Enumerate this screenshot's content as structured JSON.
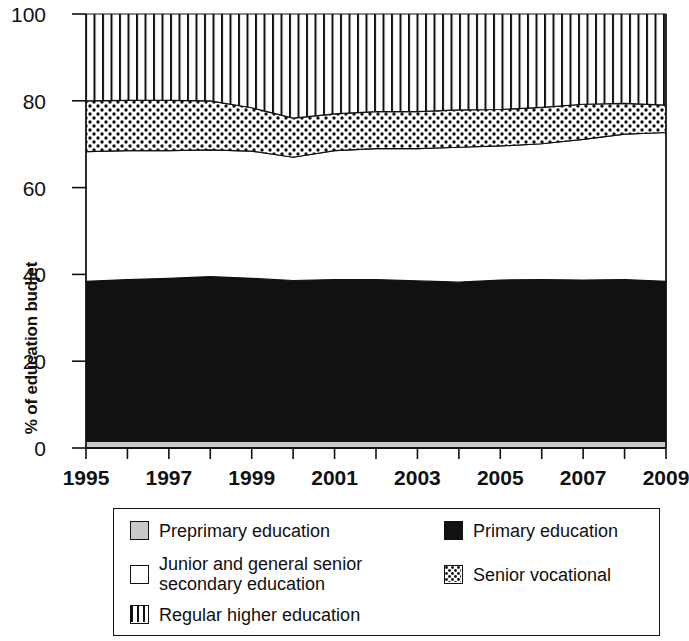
{
  "chart_data": {
    "type": "area",
    "title": "",
    "subtitle": "",
    "xlabel": "",
    "ylabel": "% of education budjet",
    "stacked": true,
    "grid": false,
    "legend_position": "bottom",
    "xlim": [
      1995,
      2009
    ],
    "ylim": [
      0,
      100
    ],
    "ytick_values": [
      0,
      20,
      40,
      60,
      80,
      100
    ],
    "ytick_labels": [
      "0",
      "20",
      "40",
      "60",
      "80",
      "100"
    ],
    "x": [
      1995,
      1996,
      1997,
      1998,
      1999,
      2000,
      2001,
      2002,
      2003,
      2004,
      2005,
      2006,
      2007,
      2008,
      2009
    ],
    "xtick_values": [
      1995,
      1996,
      1997,
      1998,
      1999,
      2000,
      2001,
      2002,
      2003,
      2004,
      2005,
      2006,
      2007,
      2008,
      2009
    ],
    "xtick_labels": [
      "1995",
      "",
      "1997",
      "",
      "1999",
      "",
      "2001",
      "",
      "2003",
      "",
      "2005",
      "",
      "2007",
      "",
      "2009"
    ],
    "series": [
      {
        "name": "Preprimary education",
        "fill": "light-gray",
        "color": "#c8c8c8",
        "values": [
          1.5,
          1.5,
          1.5,
          1.5,
          1.5,
          1.5,
          1.5,
          1.5,
          1.5,
          1.5,
          1.5,
          1.5,
          1.5,
          1.5,
          1.5
        ]
      },
      {
        "name": "Primary education",
        "fill": "solid-black",
        "color": "#111111",
        "values": [
          36.9,
          37.3,
          37.6,
          38.0,
          37.6,
          37.1,
          37.3,
          37.3,
          37.0,
          36.7,
          37.2,
          37.3,
          37.2,
          37.3,
          36.9
        ]
      },
      {
        "name": "Junior and general senior secondary education",
        "fill": "white",
        "color": "#ffffff",
        "values": [
          29.9,
          29.7,
          29.4,
          29.2,
          29.3,
          28.4,
          29.7,
          30.2,
          30.5,
          31.1,
          30.9,
          31.3,
          32.4,
          33.5,
          34.3
        ]
      },
      {
        "name": "Senior vocational",
        "fill": "dotted",
        "color": "#ffffff",
        "values": [
          11.7,
          11.6,
          11.6,
          11.3,
          10.0,
          9.0,
          8.5,
          8.5,
          8.5,
          8.6,
          8.4,
          8.4,
          8.1,
          7.1,
          6.3
        ]
      },
      {
        "name": "Regular higher education",
        "fill": "vertical-stripes",
        "color": "#ffffff",
        "values": [
          20.0,
          19.9,
          19.9,
          20.0,
          21.6,
          24.0,
          23.0,
          22.5,
          22.5,
          22.1,
          22.0,
          21.5,
          20.8,
          20.6,
          21.0
        ]
      }
    ],
    "cumulative_tops": {
      "preprimary": [
        1.5,
        1.5,
        1.5,
        1.5,
        1.5,
        1.5,
        1.5,
        1.5,
        1.5,
        1.5,
        1.5,
        1.5,
        1.5,
        1.5,
        1.5
      ],
      "primary": [
        38.4,
        38.8,
        39.1,
        39.5,
        39.1,
        38.6,
        38.8,
        38.8,
        38.5,
        38.2,
        38.7,
        38.8,
        38.7,
        38.8,
        38.4
      ],
      "junior_secondary": [
        68.3,
        68.5,
        68.5,
        68.7,
        68.4,
        67.0,
        68.5,
        69.0,
        69.0,
        69.3,
        69.6,
        70.1,
        71.1,
        72.3,
        72.7
      ],
      "senior_vocational": [
        80.0,
        80.1,
        80.1,
        80.0,
        78.4,
        76.0,
        77.0,
        77.5,
        77.5,
        77.9,
        78.0,
        78.5,
        79.2,
        79.4,
        79.0
      ],
      "higher_education": [
        100,
        100,
        100,
        100,
        100,
        100,
        100,
        100,
        100,
        100,
        100,
        100,
        100,
        100,
        100
      ]
    }
  },
  "legend": {
    "items": [
      {
        "label": "Preprimary education",
        "swatch": "light-gray"
      },
      {
        "label": "Junior and general senior secondary education",
        "swatch": "white"
      },
      {
        "label": "Regular higher education",
        "swatch": "vertical-stripes"
      },
      {
        "label": "Primary education",
        "swatch": "solid-black"
      },
      {
        "label": "Senior vocational",
        "swatch": "dotted"
      }
    ],
    "junior_line1": "Junior and general senior",
    "junior_line2": "secondary education"
  }
}
